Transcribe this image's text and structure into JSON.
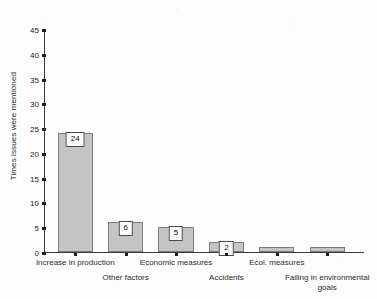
{
  "chart_data": {
    "type": "bar",
    "title": "",
    "xlabel": "",
    "ylabel": "Times issues were mentioned",
    "ylim": [
      0,
      45
    ],
    "ytick_values": [
      0,
      5,
      10,
      15,
      20,
      25,
      30,
      35,
      40,
      45
    ],
    "ytick_labels": [
      "0",
      "5",
      "10",
      "15",
      "20",
      "25",
      "30",
      "35",
      "40",
      "45"
    ],
    "grid": false,
    "legend": "none",
    "bar_color": "#c4c4c4",
    "bar_edge_color": "#7d7d7d",
    "categories": [
      "Increase in production",
      "Other factors",
      "Economic measures",
      "Accidents",
      "Ecol. measures",
      "Failing in environmental goals"
    ],
    "values": [
      24,
      6,
      5,
      2,
      1,
      1
    ],
    "data_labels": [
      "24",
      "6",
      "5",
      "2",
      "",
      ""
    ],
    "label_rows": [
      "top",
      "bottom",
      "top",
      "bottom",
      "top",
      "bottom"
    ]
  }
}
